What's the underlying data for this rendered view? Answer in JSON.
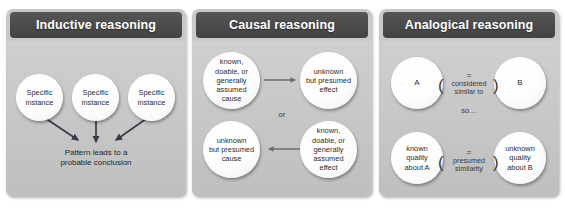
{
  "panels": [
    {
      "id": "inductive",
      "title": "Inductive reasoning",
      "circles": [
        {
          "lines": [
            "Specific",
            "instance"
          ]
        },
        {
          "lines": [
            "Specific",
            "instance"
          ]
        },
        {
          "lines": [
            "Specific",
            "instance"
          ]
        }
      ],
      "conclusion": [
        "Pattern leads to a",
        "probable conclusion"
      ]
    },
    {
      "id": "causal",
      "title": "Causal reasoning",
      "circles": [
        {
          "lines": [
            "known,",
            "doable, or",
            "generally",
            "assumed",
            "cause"
          ]
        },
        {
          "lines": [
            "unknown",
            "but presumed",
            "effect"
          ]
        },
        {
          "lines": [
            "unknown",
            "but presumed",
            "cause"
          ]
        },
        {
          "lines": [
            "known,",
            "doable, or",
            "generally",
            "assumed",
            "effect"
          ]
        }
      ],
      "connector": "or"
    },
    {
      "id": "analogical",
      "title": "Analogical reasoning",
      "circles": [
        {
          "lines": [
            "A"
          ]
        },
        {
          "lines": [
            "B"
          ]
        },
        {
          "lines": [
            "known",
            "quality",
            "about A"
          ]
        },
        {
          "lines": [
            "unknown",
            "quality",
            "about B"
          ]
        }
      ],
      "equals_top": "=",
      "relation_top": [
        "considered",
        "similar to"
      ],
      "connector": "so…",
      "equals_bottom": "=",
      "relation_bottom": [
        "presumed",
        "similarity"
      ]
    }
  ],
  "colors": {
    "header_bg": "#4a4a4a",
    "panel_bg": "#c9c9c9",
    "circle_fill": "#ffffff",
    "arrow": "#3a3a4a",
    "text": "#1f1f1f"
  }
}
